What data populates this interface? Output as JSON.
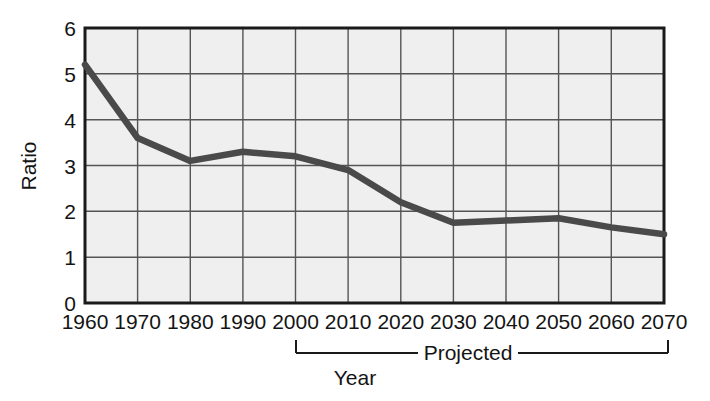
{
  "chart_data": {
    "type": "line",
    "title": "",
    "subtitle": "",
    "xlabel": "Year",
    "ylabel": "Ratio",
    "x": [
      1960,
      1970,
      1980,
      1990,
      2000,
      2010,
      2020,
      2030,
      2040,
      2050,
      2060,
      2070
    ],
    "categories": [
      "1960",
      "1970",
      "1980",
      "1990",
      "2000",
      "2010",
      "2020",
      "2030",
      "2040",
      "2050",
      "2060",
      "2070"
    ],
    "values": [
      5.2,
      3.6,
      3.1,
      3.3,
      3.2,
      2.9,
      2.2,
      1.75,
      1.8,
      1.85,
      1.65,
      1.5
    ],
    "series": [
      {
        "name": "Ratio",
        "values": [
          5.2,
          3.6,
          3.1,
          3.3,
          3.2,
          2.9,
          2.2,
          1.75,
          1.8,
          1.85,
          1.65,
          1.5
        ]
      }
    ],
    "ylim": [
      0,
      6
    ],
    "xlim": [
      1960,
      2070
    ],
    "ytick_labels": [
      "0",
      "1",
      "2",
      "3",
      "4",
      "5",
      "6"
    ],
    "ytick_values": [
      0,
      1,
      2,
      3,
      4,
      5,
      6
    ],
    "xtick_labels": [
      "1960",
      "1970",
      "1980",
      "1990",
      "2000",
      "2010",
      "2020",
      "2030",
      "2040",
      "2050",
      "2060",
      "2070"
    ],
    "grid": true,
    "legend": "none",
    "line_color": "#4a4a4a",
    "plot_background": "#efefef",
    "grid_color": "#555555",
    "axis_color": "#1a1a1a",
    "annotations": [
      {
        "name": "projected-bracket",
        "label": "Projected",
        "from": "2000",
        "to": "2070"
      }
    ]
  },
  "axis": {
    "y_title": "Ratio",
    "x_title": "Year",
    "y_ticks": [
      "6",
      "5",
      "4",
      "3",
      "2",
      "1",
      "0"
    ],
    "x_ticks": [
      "1960",
      "1970",
      "1980",
      "1990",
      "2000",
      "2010",
      "2020",
      "2030",
      "2040",
      "2050",
      "2060",
      "2070"
    ]
  },
  "annotation": {
    "projected_label": "Projected"
  }
}
